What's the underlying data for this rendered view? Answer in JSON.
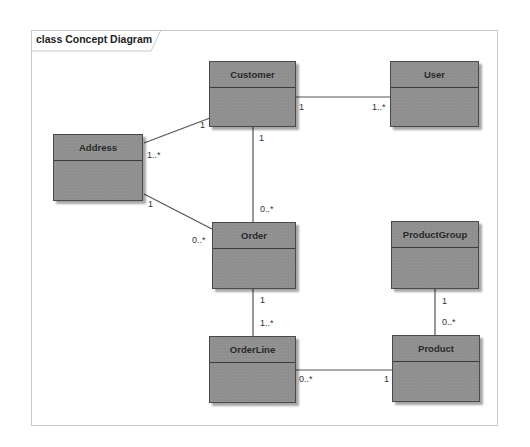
{
  "diagram": {
    "title": "class Concept Diagram",
    "classes": [
      {
        "id": "customer",
        "name": "Customer"
      },
      {
        "id": "user",
        "name": "User"
      },
      {
        "id": "address",
        "name": "Address"
      },
      {
        "id": "order",
        "name": "Order"
      },
      {
        "id": "productgroup",
        "name": "ProductGroup"
      },
      {
        "id": "orderline",
        "name": "OrderLine"
      },
      {
        "id": "product",
        "name": "Product"
      }
    ],
    "associations": [
      {
        "from": "Customer",
        "to": "User",
        "from_mult": "1",
        "to_mult": "1..*"
      },
      {
        "from": "Customer",
        "to": "Address",
        "from_mult": "1",
        "to_mult": "1..*"
      },
      {
        "from": "Customer",
        "to": "Order",
        "from_mult": "1",
        "to_mult": "0..*"
      },
      {
        "from": "Address",
        "to": "Order",
        "from_mult": "1",
        "to_mult": "0..*"
      },
      {
        "from": "Order",
        "to": "OrderLine",
        "from_mult": "1",
        "to_mult": "1..*"
      },
      {
        "from": "OrderLine",
        "to": "Product",
        "from_mult": "0..*",
        "to_mult": "1"
      },
      {
        "from": "ProductGroup",
        "to": "Product",
        "from_mult": "1",
        "to_mult": "0..*"
      }
    ],
    "colors": {
      "class_fill": "#8f8f8f",
      "class_border": "#4a4a4a",
      "line": "#555555",
      "frame": "#c8c8c8"
    }
  }
}
